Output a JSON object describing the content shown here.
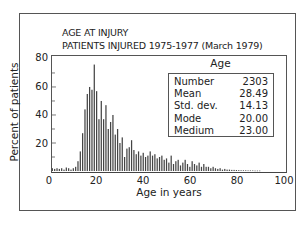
{
  "chart_data": {
    "type": "bar",
    "title": "AGE AT INJURY",
    "subtitle": "PATIENTS INJURED 1975-1977 (March 1979)",
    "xlabel": "Age in years",
    "ylabel": "Percent of patients",
    "xlim": [
      0,
      100
    ],
    "ylim": [
      0,
      80
    ],
    "xticks": [
      0,
      20,
      40,
      60,
      80,
      100
    ],
    "yticks": [
      20,
      40,
      60,
      80
    ],
    "grid": false,
    "x": [
      1,
      2,
      3,
      4,
      5,
      6,
      7,
      8,
      9,
      10,
      11,
      12,
      13,
      14,
      15,
      16,
      17,
      18,
      19,
      20,
      21,
      22,
      23,
      24,
      25,
      26,
      27,
      28,
      29,
      30,
      31,
      32,
      33,
      34,
      35,
      36,
      37,
      38,
      39,
      40,
      41,
      42,
      43,
      44,
      45,
      46,
      47,
      48,
      49,
      50,
      51,
      52,
      53,
      54,
      55,
      56,
      57,
      58,
      59,
      60,
      61,
      62,
      63,
      64,
      65,
      66,
      67,
      68,
      69,
      70,
      71,
      72,
      73,
      74,
      75,
      76,
      77,
      78,
      79,
      80,
      81,
      82,
      83,
      84,
      85,
      86,
      87,
      88,
      89,
      90
    ],
    "values": [
      2,
      1.5,
      2,
      1.5,
      2,
      1,
      2.5,
      2,
      1,
      2,
      3,
      7,
      14,
      27,
      44,
      55,
      60,
      58,
      76,
      57,
      37,
      50,
      37,
      47,
      30,
      35,
      40,
      26,
      30,
      20,
      24,
      10,
      16,
      17,
      22,
      15,
      12,
      14,
      11,
      13,
      10,
      11,
      14,
      11,
      12,
      9,
      10,
      11,
      8,
      9,
      6,
      11,
      5,
      7,
      8,
      4,
      6,
      8,
      5,
      3,
      7,
      5,
      4,
      6,
      3,
      5,
      3,
      3,
      2,
      3,
      2,
      1.5,
      2,
      1,
      1.5,
      1,
      1,
      0.8,
      0.8,
      0.7,
      0.6,
      0.5,
      0.5,
      0.5,
      0.4,
      0.4,
      0.4,
      0.3,
      0.3,
      0.3
    ],
    "bar_color": "#444444",
    "stats_box": {
      "header": "Age",
      "rows": [
        {
          "label": "Number",
          "value": "2303"
        },
        {
          "label": "Mean",
          "value": "28.49"
        },
        {
          "label": "Std. dev.",
          "value": "14.13"
        },
        {
          "label": "Mode",
          "value": "20.00"
        },
        {
          "label": "Medium",
          "value": "23.00"
        }
      ]
    }
  }
}
